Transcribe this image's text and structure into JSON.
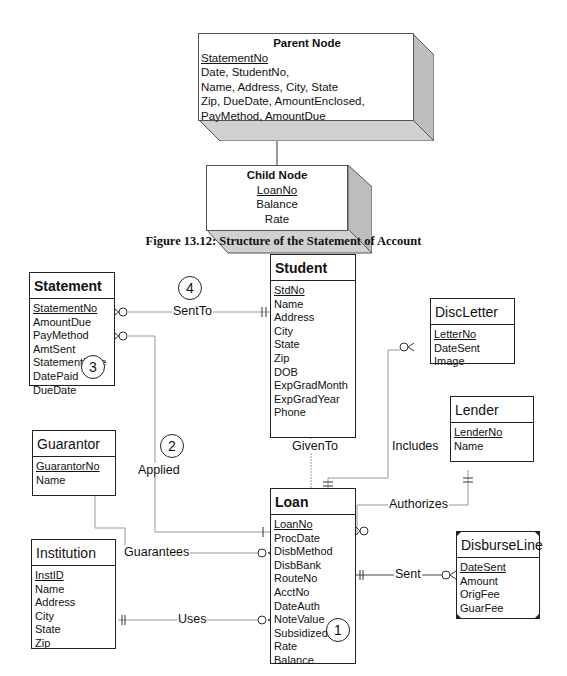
{
  "figure_caption": "Figure 13.12: Structure of the Statement of Account",
  "parent_node": {
    "title": "Parent Node",
    "key": "StatementNo",
    "lines": [
      "Date, StudentNo,",
      "Name, Address, City, State",
      "Zip, DueDate, AmountEnclosed,",
      "PayMethod, AmountDue"
    ]
  },
  "child_node": {
    "title": "Child Node",
    "key": "LoanNo",
    "lines": [
      "Balance",
      "Rate"
    ]
  },
  "entities": {
    "statement": {
      "name": "Statement",
      "key": "StatementNo",
      "attrs": [
        "AmountDue",
        "PayMethod",
        "AmtSent",
        "StatementDate",
        "DatePaid",
        "DueDate"
      ]
    },
    "student": {
      "name": "Student",
      "key": "StdNo",
      "attrs": [
        "Name",
        "Address",
        "City",
        "State",
        "Zip",
        "DOB",
        "ExpGradMonth",
        "ExpGradYear",
        "Phone"
      ]
    },
    "discletter": {
      "name": "DiscLetter",
      "key": "LetterNo",
      "attrs": [
        "DateSent",
        "Image"
      ]
    },
    "lender": {
      "name": "Lender",
      "key": "LenderNo",
      "attrs": [
        "Name"
      ]
    },
    "guarantor": {
      "name": "Guarantor",
      "key": "GuarantorNo",
      "attrs": [
        "Name"
      ]
    },
    "institution": {
      "name": "Institution",
      "key": "InstID",
      "attrs": [
        "Name",
        "Address",
        "City",
        "State",
        "Zip"
      ]
    },
    "loan": {
      "name": "Loan",
      "key": "LoanNo",
      "attrs": [
        "ProcDate",
        "DisbMethod",
        "DisbBank",
        "RouteNo",
        "AcctNo",
        "DateAuth",
        "NoteValue",
        "Subsidized",
        "Rate",
        "Balance"
      ]
    },
    "disburseline": {
      "name": "DisburseLine",
      "key": "DateSent",
      "attrs": [
        "Amount",
        "OrigFee",
        "GuarFee"
      ]
    }
  },
  "relationships": {
    "sentto": "SentTo",
    "applied": "Applied",
    "givento": "GivenTo",
    "includes": "Includes",
    "authorizes": "Authorizes",
    "guarantees": "Guarantees",
    "uses": "Uses",
    "sent": "Sent"
  },
  "markers": {
    "m1": "1",
    "m2": "2",
    "m3": "3",
    "m4": "4"
  }
}
